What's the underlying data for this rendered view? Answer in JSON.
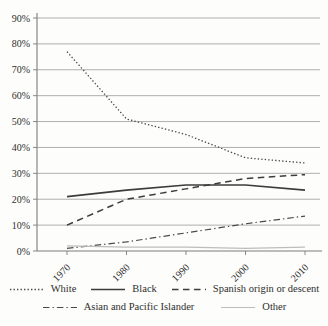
{
  "figure": {
    "background": "#fdfdfb",
    "text_color": "#2e2e2e",
    "grid_color": "#9a9a9a",
    "axis_color": "#7c7c7c",
    "line_dark": "#3f3f3f",
    "line_light": "#bdbdbd"
  },
  "chart_data": {
    "type": "line",
    "title": "",
    "xlabel": "",
    "ylabel": "",
    "x": [
      "1970",
      "1980",
      "1990",
      "2000",
      "2010"
    ],
    "series": [
      {
        "name": "White",
        "style": "dotted",
        "color": "#4a4a4a",
        "values": [
          77,
          51,
          45,
          36,
          34
        ]
      },
      {
        "name": "Black",
        "style": "solid",
        "color": "#3c3c3c",
        "values": [
          21,
          23.5,
          25.5,
          25.5,
          23.5
        ]
      },
      {
        "name": "Spanish origin or descent",
        "style": "dashed",
        "color": "#3c3c3c",
        "values": [
          10,
          20,
          24,
          28,
          29.5
        ]
      },
      {
        "name": "Asian and Pacific Islander",
        "style": "dashdot",
        "color": "#4a4a4a",
        "values": [
          1,
          3.5,
          7,
          10.5,
          13.5
        ]
      },
      {
        "name": "Other",
        "style": "light",
        "color": "#bdbdbd",
        "values": [
          2,
          1.5,
          1.5,
          1,
          1.5
        ]
      }
    ],
    "ylim": [
      0,
      90
    ],
    "ytick_step": 10,
    "ytick_suffix": "%",
    "grid": "horizontal",
    "legend_position": "bottom",
    "legend_rows": [
      [
        "White",
        "Black",
        "Spanish origin or descent"
      ],
      [
        "Asian and Pacific Islander",
        "Other"
      ]
    ]
  }
}
